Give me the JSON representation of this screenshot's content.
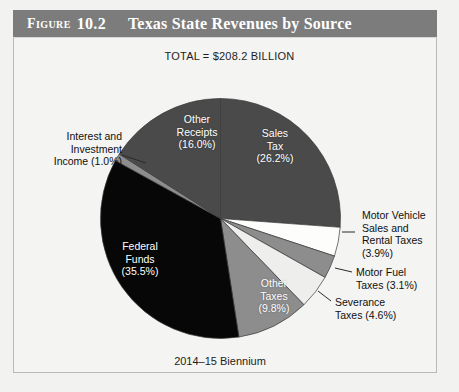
{
  "figure": {
    "label": "Figure",
    "number": "10.2",
    "title": "Texas State Revenues by Source",
    "total_line": "TOTAL = $208.2 BILLION",
    "caption": "2014–15 Biennium"
  },
  "chart_data": {
    "type": "pie",
    "title": "Texas State Revenues by Source",
    "subtitle": "TOTAL = $208.2 BILLION",
    "footnote": "2014–15 Biennium",
    "total_label": "$208.2 BILLION",
    "units": "percent of total revenue",
    "legend": "none",
    "grid": false,
    "start_angle_deg": 0,
    "direction": "clockwise",
    "categories": [
      "Sales Tax",
      "Motor Vehicle Sales and Rental Taxes",
      "Motor Fuel Taxes",
      "Severance Taxes",
      "Other Taxes",
      "Federal Funds",
      "Interest and Investment Income",
      "Other Receipts"
    ],
    "values": [
      26.2,
      3.9,
      3.1,
      4.6,
      9.8,
      35.5,
      1.0,
      16.0
    ],
    "slices": [
      {
        "name": "Sales Tax",
        "value": 26.2,
        "percent_text": "(26.2%)",
        "label_lines": [
          "Sales",
          "Tax",
          "(26.2%)"
        ],
        "color": "#4a4a4a",
        "text_color": "#ffffff",
        "label_placement": "inside"
      },
      {
        "name": "Motor Vehicle Sales and Rental Taxes",
        "value": 3.9,
        "percent_text": "(3.9%)",
        "label_lines": [
          "Motor Vehicle",
          "Sales and",
          "Rental Taxes",
          "(3.9%)"
        ],
        "color": "#fdfdfb",
        "text_color": "#101010",
        "label_placement": "callout-right"
      },
      {
        "name": "Motor Fuel Taxes",
        "value": 3.1,
        "percent_text": "(3.1%)",
        "label_lines": [
          "Motor Fuel",
          "Taxes (3.1%)"
        ],
        "color": "#8d8d8d",
        "text_color": "#101010",
        "label_placement": "callout-right"
      },
      {
        "name": "Severance Taxes",
        "value": 4.6,
        "percent_text": "(4.6%)",
        "label_lines": [
          "Severance",
          "Taxes (4.6%)"
        ],
        "color": "#eeeeec",
        "text_color": "#101010",
        "label_placement": "callout-right"
      },
      {
        "name": "Other Taxes",
        "value": 9.8,
        "percent_text": "(9.8%)",
        "label_lines": [
          "Other",
          "Taxes",
          "(9.8%)"
        ],
        "color": "#8d8d8d",
        "text_color": "#ffffff",
        "label_placement": "inside"
      },
      {
        "name": "Federal Funds",
        "value": 35.5,
        "percent_text": "(35.5%)",
        "label_lines": [
          "Federal",
          "Funds",
          "(35.5%)"
        ],
        "color": "#070707",
        "text_color": "#ffffff",
        "label_placement": "inside"
      },
      {
        "name": "Interest and Investment Income",
        "value": 1.0,
        "percent_text": "(1.0%)",
        "label_lines": [
          "Interest and",
          "Investment",
          "Income (1.0%)"
        ],
        "color": "#8d8d8d",
        "text_color": "#101010",
        "label_placement": "callout-left"
      },
      {
        "name": "Other Receipts",
        "value": 16.0,
        "percent_text": "(16.0%)",
        "label_lines": [
          "Other",
          "Receipts",
          "(16.0%)"
        ],
        "color": "#4a4a4a",
        "text_color": "#ffffff",
        "label_placement": "inside"
      }
    ]
  },
  "labels": {
    "sales_tax": "Sales\nTax\n(26.2%)",
    "other_receipts": "Other\nReceipts\n(16.0%)",
    "federal_funds": "Federal\nFunds\n(35.5%)",
    "other_taxes": "Other\nTaxes\n(9.8%)",
    "interest": "Interest and\nInvestment\nIncome (1.0%)",
    "motor_vehicle": "Motor Vehicle\nSales and\nRental Taxes\n(3.9%)",
    "motor_fuel": "Motor Fuel\nTaxes (3.1%)",
    "severance": "Severance\nTaxes (4.6%)"
  },
  "colors": {
    "header_bar": "#7c7c7c",
    "page_background": "#f2f2f0",
    "panel_background": "#f4f4f2",
    "frame_border": "#b9b9b7",
    "slice_dark_gray": "#4a4a4a",
    "slice_black": "#070707",
    "slice_mid_gray": "#8d8d8d",
    "slice_white": "#fdfdfb",
    "slice_offwhite": "#eeeeec",
    "text_dark": "#101010",
    "text_light": "#ffffff"
  }
}
